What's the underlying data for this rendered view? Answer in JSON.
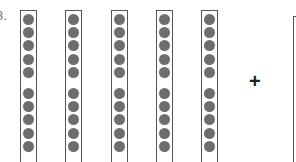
{
  "problem": {
    "number_label": "3.",
    "operator": "+",
    "rods": [
      {
        "dots": 10
      },
      {
        "dots": 10
      },
      {
        "dots": 10
      },
      {
        "dots": 10
      },
      {
        "dots": 10
      }
    ],
    "dot_group_size": 5,
    "colors": {
      "dot": "#6e6e6e",
      "border": "#555555"
    }
  }
}
